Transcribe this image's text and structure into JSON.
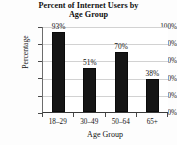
{
  "chart_data": {
    "type": "bar",
    "title": "Percent of Internet Users by Age Group",
    "title_lines": [
      "Percent of Internet Users by",
      "Age Group"
    ],
    "categories": [
      "18–29",
      "30–49",
      "50–64",
      "65+"
    ],
    "values": [
      93,
      51,
      70,
      38
    ],
    "value_labels": [
      "93%",
      "51%",
      "70%",
      "38%"
    ],
    "xlabel": "Age Group",
    "ylabel": "Percentage",
    "ylim": [
      0,
      100
    ],
    "ytick_values": [
      0,
      20,
      40,
      60,
      80,
      100
    ],
    "ytick_labels": [
      "0%",
      "20%",
      "40%",
      "60%",
      "80%",
      "100%"
    ],
    "grid": true,
    "legend": false,
    "bar_color": "#151515",
    "grid_color": "#d2d2d2",
    "text_color": "#141414"
  }
}
